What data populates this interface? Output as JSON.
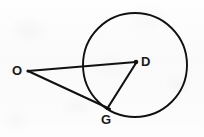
{
  "figure": {
    "background_color": "#fdfdfd",
    "stroke_color": "#111111",
    "labels": {
      "O": "O",
      "D": "D",
      "G": "G"
    },
    "circle": {
      "name": "circle-D",
      "center_x": 135,
      "center_y": 65,
      "radius": 52,
      "stroke_width": 1.9
    },
    "points": [
      {
        "name": "point-O",
        "label": "O",
        "x": 28,
        "y": 71,
        "on_circle": false,
        "is_center": false,
        "marker": "line-endpoint"
      },
      {
        "name": "point-D",
        "label": "D",
        "x": 136,
        "y": 62,
        "on_circle": false,
        "is_center": true,
        "marker": "dot"
      },
      {
        "name": "point-G",
        "label": "G",
        "x": 107,
        "y": 107,
        "on_circle": true,
        "is_center": false,
        "marker": "line-endpoint"
      }
    ],
    "segments": [
      {
        "name": "segment-OD",
        "from": "O",
        "to": "D",
        "x1": 28,
        "y1": 71,
        "x2": 136,
        "y2": 62,
        "stroke_width": 2.1
      },
      {
        "name": "segment-OG",
        "from": "O",
        "to": "G",
        "x1": 28,
        "y1": 71,
        "x2": 110,
        "y2": 109,
        "stroke_width": 2.1
      },
      {
        "name": "segment-DG",
        "from": "D",
        "to": "G",
        "x1": 136,
        "y1": 63,
        "x2": 107,
        "y2": 109,
        "stroke_width": 2.1
      }
    ]
  }
}
